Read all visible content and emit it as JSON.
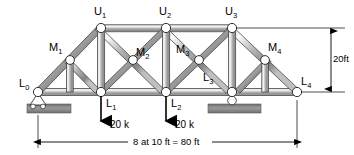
{
  "figure": {
    "span_label": "8 at 10 ft = 80 ft",
    "height_label": "20ft"
  },
  "joints": {
    "top": [
      {
        "name": "U1",
        "base": "U",
        "sub": "1",
        "x": 101,
        "y": 28
      },
      {
        "name": "U2",
        "base": "U",
        "sub": "2",
        "x": 166,
        "y": 28
      },
      {
        "name": "U3",
        "base": "U",
        "sub": "3",
        "x": 232,
        "y": 28
      }
    ],
    "mid": [
      {
        "name": "M1",
        "base": "M",
        "sub": "1",
        "x": 70,
        "y": 60
      },
      {
        "name": "M2",
        "base": "M",
        "sub": "2",
        "x": 133,
        "y": 60
      },
      {
        "name": "M3",
        "base": "M",
        "sub": "3",
        "x": 199,
        "y": 60
      },
      {
        "name": "M4",
        "base": "M",
        "sub": "4",
        "x": 265,
        "y": 60
      }
    ],
    "bottom": [
      {
        "name": "L0",
        "base": "L",
        "sub": "0",
        "x": 38,
        "y": 92
      },
      {
        "name": "L1",
        "base": "L",
        "sub": "1",
        "x": 101,
        "y": 92
      },
      {
        "name": "L2",
        "base": "L",
        "sub": "2",
        "x": 166,
        "y": 92
      },
      {
        "name": "L3",
        "base": "L",
        "sub": "3",
        "x": 232,
        "y": 92
      },
      {
        "name": "L4",
        "base": "L",
        "sub": "4",
        "x": 297,
        "y": 92
      }
    ]
  },
  "labels": {
    "U1": {
      "base": "U",
      "sub": "1"
    },
    "U2": {
      "base": "U",
      "sub": "2"
    },
    "U3": {
      "base": "U",
      "sub": "3"
    },
    "M1": {
      "base": "M",
      "sub": "1"
    },
    "M2": {
      "base": "M",
      "sub": "2"
    },
    "M3": {
      "base": "M",
      "sub": "3"
    },
    "M4": {
      "base": "M",
      "sub": "4"
    },
    "L0": {
      "base": "L",
      "sub": "0"
    },
    "L1": {
      "base": "L",
      "sub": "1"
    },
    "L2": {
      "base": "L",
      "sub": "2"
    },
    "L3": {
      "base": "L",
      "sub": "3"
    },
    "L4": {
      "base": "L",
      "sub": "4"
    }
  },
  "loads": [
    {
      "joint": "L1",
      "value": "20 k",
      "x": 101
    },
    {
      "joint": "L2",
      "value": "20 k",
      "x": 166
    }
  ],
  "supports": [
    {
      "type": "pin-roller",
      "joint": "L0",
      "x": 38
    },
    {
      "type": "roller",
      "joint": "L3",
      "x": 232
    }
  ],
  "colors": {
    "member_light": "#f2f2f2",
    "member_mid": "#b8b8b8",
    "member_dark": "#6e6e6e",
    "outline": "#2a2a2a",
    "ground": "#8a8a8a",
    "joint_fill": "#ffffff",
    "text": "#000000"
  }
}
